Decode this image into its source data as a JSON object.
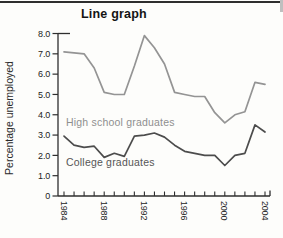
{
  "page": {
    "title": "Line graph"
  },
  "chart_data": {
    "type": "line",
    "title": "Line graph",
    "xlabel": "",
    "ylabel": "Percentage unemployed",
    "ylim": [
      0,
      8
    ],
    "ytick_step": 1.0,
    "grid": false,
    "legend": "inline-labels",
    "y_ticks": [
      {
        "value": 8,
        "label": "8.0"
      },
      {
        "value": 7,
        "label": "7.0"
      },
      {
        "value": 6,
        "label": "6.0"
      },
      {
        "value": 5,
        "label": "5.0"
      },
      {
        "value": 4,
        "label": "4.0"
      },
      {
        "value": 3,
        "label": "3.0"
      },
      {
        "value": 2,
        "label": "2.0"
      },
      {
        "value": 1,
        "label": "1.0"
      },
      {
        "value": 0,
        "label": "0"
      }
    ],
    "x": [
      1984,
      1985,
      1986,
      1987,
      1988,
      1989,
      1990,
      1991,
      1992,
      1993,
      1994,
      1995,
      1996,
      1997,
      1998,
      1999,
      2000,
      2001,
      2002,
      2003,
      2004
    ],
    "x_labeled_ticks": [
      1984,
      1988,
      1992,
      1996,
      2000,
      2004
    ],
    "series": [
      {
        "name": "High school graduates",
        "color": "#949494",
        "values": [
          7.1,
          7.05,
          7.0,
          6.3,
          5.1,
          5.0,
          5.0,
          6.4,
          7.9,
          7.3,
          6.5,
          5.1,
          5.0,
          4.9,
          4.9,
          4.1,
          3.6,
          4.0,
          4.15,
          5.6,
          5.5
        ]
      },
      {
        "name": "College graduates",
        "color": "#4c4c4c",
        "values": [
          2.95,
          2.5,
          2.4,
          2.45,
          1.9,
          2.1,
          1.95,
          2.95,
          3.0,
          3.1,
          2.9,
          2.5,
          2.2,
          2.1,
          2.0,
          2.0,
          1.5,
          2.0,
          2.1,
          3.5,
          3.15
        ]
      }
    ],
    "axis_color": "#2e2e2e",
    "tick_label_color": "#222222"
  }
}
